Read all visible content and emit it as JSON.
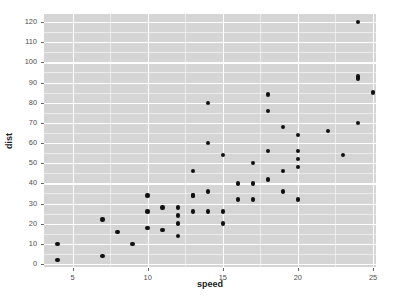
{
  "chart_data": {
    "type": "scatter",
    "title": "",
    "xlabel": "speed",
    "ylabel": "dist",
    "xlim": [
      3.1,
      25.2
    ],
    "ylim": [
      -1.5,
      124
    ],
    "xticks": [
      5,
      10,
      15,
      20,
      25
    ],
    "yticks": [
      0,
      10,
      20,
      30,
      40,
      50,
      60,
      70,
      80,
      90,
      100,
      110,
      120
    ],
    "x_minor_ticks": [
      7.5,
      12.5,
      17.5,
      22.5
    ],
    "y_minor_ticks": [
      5,
      15,
      25,
      35,
      45,
      55,
      65,
      75,
      85,
      95,
      105,
      115
    ],
    "grid": true,
    "legend": "none",
    "point_color": "#111111",
    "panel_background": "#d5d5d5",
    "gridline_color": "#ffffff",
    "series": [
      {
        "name": "cars",
        "x": [
          4,
          4,
          7,
          7,
          8,
          9,
          10,
          10,
          10,
          11,
          11,
          12,
          12,
          12,
          12,
          13,
          13,
          13,
          13,
          14,
          14,
          14,
          14,
          15,
          15,
          15,
          16,
          16,
          17,
          17,
          17,
          18,
          18,
          18,
          18,
          19,
          19,
          19,
          20,
          20,
          20,
          20,
          20,
          22,
          23,
          24,
          24,
          24,
          24,
          25
        ],
        "y": [
          2,
          10,
          4,
          22,
          16,
          10,
          18,
          26,
          34,
          17,
          28,
          14,
          20,
          24,
          28,
          26,
          34,
          34,
          46,
          26,
          36,
          60,
          80,
          20,
          26,
          54,
          32,
          40,
          32,
          40,
          50,
          42,
          56,
          76,
          84,
          36,
          46,
          68,
          32,
          48,
          52,
          56,
          64,
          66,
          54,
          70,
          92,
          93,
          120,
          85
        ]
      }
    ]
  },
  "axes": {
    "x_title": "speed",
    "y_title": "dist",
    "x_tick_labels": [
      "5",
      "10",
      "15",
      "20",
      "25"
    ],
    "y_tick_labels": [
      "0",
      "10",
      "20",
      "30",
      "40",
      "50",
      "60",
      "70",
      "80",
      "90",
      "100",
      "110",
      "120"
    ]
  }
}
